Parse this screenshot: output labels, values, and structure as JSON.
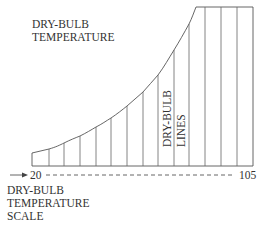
{
  "diagram": {
    "title_label": {
      "line1": "DRY-BULB",
      "line2": "TEMPERATURE"
    },
    "lines_label": {
      "line1": "DRY-BULB",
      "line2": "LINES"
    },
    "scale": {
      "start_value": "20",
      "end_value": "105",
      "arrow": "right-arrow"
    },
    "scale_label": {
      "line1": "DRY-BULB",
      "line2": "TEMPERATURE",
      "line3": "SCALE"
    },
    "colors": {
      "line": "#555555",
      "text": "#333333",
      "background": "#ffffff"
    }
  }
}
